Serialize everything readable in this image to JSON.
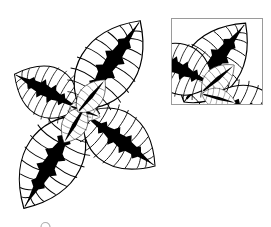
{
  "illustration": {
    "subject": "top-view plant with four large patterned leaves and small center leaves",
    "style": "black line art on white",
    "colors": {
      "ink": "#000000",
      "background": "#ffffff",
      "frame": "#9a9a9a"
    },
    "main_plant": {
      "center": [
        80,
        110
      ],
      "leaves": [
        {
          "name": "leaf-top-right",
          "base": [
            82,
            106
          ],
          "tip": [
            142,
            19
          ],
          "width": 52,
          "large": true
        },
        {
          "name": "leaf-left",
          "base": [
            76,
            104
          ],
          "tip": [
            15,
            72
          ],
          "width": 46,
          "large": true
        },
        {
          "name": "leaf-bottom-right",
          "base": [
            84,
            114
          ],
          "tip": [
            155,
            166
          ],
          "width": 46,
          "large": true
        },
        {
          "name": "leaf-bottom-left",
          "base": [
            78,
            116
          ],
          "tip": [
            24,
            208
          ],
          "width": 52,
          "large": true
        },
        {
          "name": "leaf-center-upper",
          "base": [
            80,
            110
          ],
          "tip": [
            108,
            80
          ],
          "width": 22,
          "large": false
        },
        {
          "name": "leaf-center-lower",
          "base": [
            80,
            112
          ],
          "tip": [
            60,
            142
          ],
          "width": 22,
          "large": false
        },
        {
          "name": "leaf-center-small",
          "base": [
            80,
            110
          ],
          "tip": [
            100,
            120
          ],
          "width": 14,
          "large": false
        }
      ]
    },
    "inset": {
      "frame": {
        "x": 171,
        "y": 18,
        "width": 92,
        "height": 87
      },
      "content": "cropped magnified view of the upper-right of the plant"
    },
    "bud": {
      "cx": 45,
      "cy": 224,
      "r": 4
    }
  }
}
